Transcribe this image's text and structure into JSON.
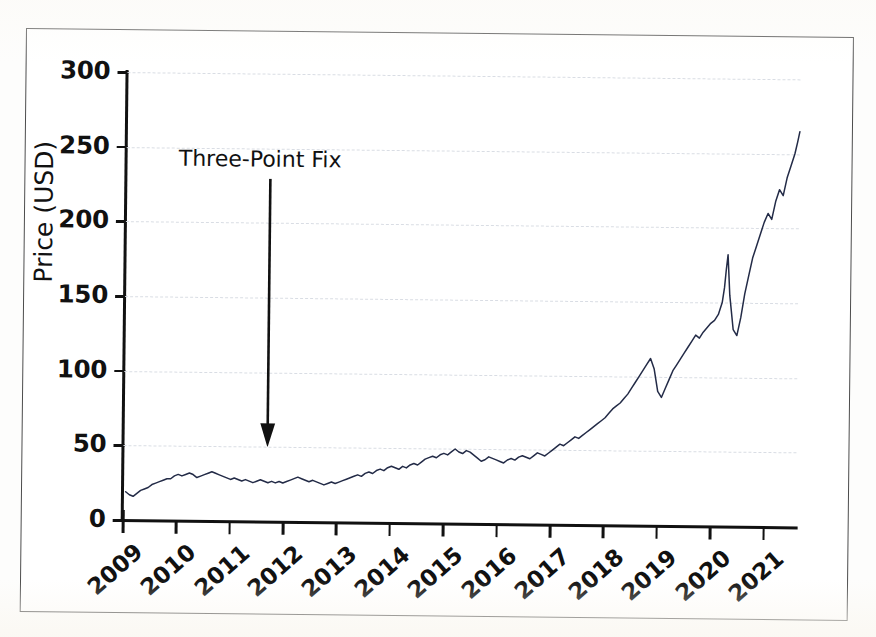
{
  "figure": {
    "frame_border_color": "#4c4c4c",
    "background": "#ffffff"
  },
  "chart_data": {
    "type": "line",
    "title": "",
    "subtitle": "",
    "xlabel": "",
    "ylabel": "Price (USD)",
    "xlim": [
      2009,
      2021.6
    ],
    "ylim": [
      0,
      300
    ],
    "ytick_labels": [
      "300",
      "250",
      "200",
      "150",
      "100",
      "50",
      "0"
    ],
    "ytick_values": [
      300,
      250,
      200,
      150,
      100,
      50,
      0
    ],
    "xtick_labels": [
      "2009",
      "2010",
      "2011",
      "2012",
      "2013",
      "2014",
      "2015",
      "2016",
      "2017",
      "2018",
      "2019",
      "2020",
      "2021"
    ],
    "xtick_values": [
      2009,
      2010,
      2011,
      2012,
      2013,
      2014,
      2015,
      2016,
      2017,
      2018,
      2019,
      2020,
      2021
    ],
    "grid": true,
    "grid_color": "#d9dde4",
    "grid_style": "dashed",
    "legend": "none",
    "series": [
      {
        "name": "Price",
        "color": "#232b47",
        "line_width": 1.5,
        "x": [
          2009.05,
          2009.12,
          2009.19,
          2009.26,
          2009.33,
          2009.4,
          2009.47,
          2009.54,
          2009.61,
          2009.68,
          2009.75,
          2009.82,
          2009.89,
          2009.96,
          2010.03,
          2010.1,
          2010.17,
          2010.24,
          2010.31,
          2010.38,
          2010.45,
          2010.52,
          2010.59,
          2010.66,
          2010.73,
          2010.8,
          2010.87,
          2010.94,
          2011.01,
          2011.08,
          2011.15,
          2011.22,
          2011.29,
          2011.36,
          2011.43,
          2011.5,
          2011.57,
          2011.64,
          2011.71,
          2011.78,
          2011.85,
          2011.92,
          2011.99,
          2012.06,
          2012.13,
          2012.2,
          2012.27,
          2012.34,
          2012.41,
          2012.48,
          2012.55,
          2012.62,
          2012.69,
          2012.76,
          2012.83,
          2012.9,
          2012.97,
          2013.04,
          2013.11,
          2013.18,
          2013.25,
          2013.32,
          2013.39,
          2013.46,
          2013.53,
          2013.6,
          2013.67,
          2013.74,
          2013.81,
          2013.88,
          2013.95,
          2014.02,
          2014.09,
          2014.16,
          2014.23,
          2014.3,
          2014.37,
          2014.44,
          2014.51,
          2014.58,
          2014.65,
          2014.72,
          2014.79,
          2014.86,
          2014.93,
          2015.0,
          2015.07,
          2015.14,
          2015.21,
          2015.28,
          2015.35,
          2015.42,
          2015.49,
          2015.56,
          2015.63,
          2015.7,
          2015.77,
          2015.84,
          2015.91,
          2015.98,
          2016.05,
          2016.12,
          2016.19,
          2016.26,
          2016.33,
          2016.4,
          2016.47,
          2016.54,
          2016.61,
          2016.68,
          2016.75,
          2016.82,
          2016.89,
          2016.96,
          2017.03,
          2017.1,
          2017.17,
          2017.24,
          2017.31,
          2017.38,
          2017.45,
          2017.52,
          2017.59,
          2017.66,
          2017.73,
          2017.8,
          2017.87,
          2017.94,
          2018.01,
          2018.08,
          2018.15,
          2018.22,
          2018.29,
          2018.36,
          2018.43,
          2018.5,
          2018.57,
          2018.64,
          2018.71,
          2018.78,
          2018.85,
          2018.92,
          2018.99,
          2019.06,
          2019.13,
          2019.2,
          2019.27,
          2019.34,
          2019.41,
          2019.48,
          2019.55,
          2019.62,
          2019.69,
          2019.76,
          2019.83,
          2019.9,
          2019.97,
          2020.04,
          2020.11,
          2020.18,
          2020.22,
          2020.25,
          2020.28,
          2020.32,
          2020.39,
          2020.46,
          2020.53,
          2020.6,
          2020.67,
          2020.74,
          2020.81,
          2020.88,
          2020.95,
          2021.02,
          2021.09,
          2021.16,
          2021.23,
          2021.3,
          2021.37,
          2021.44,
          2021.51,
          2021.56,
          2021.6
        ],
        "y": [
          19,
          17,
          16,
          18,
          20,
          21,
          22,
          24,
          25,
          26,
          27,
          28,
          28,
          30,
          31,
          30,
          31,
          32,
          31,
          29,
          30,
          31,
          32,
          33,
          32,
          31,
          30,
          29,
          28,
          29,
          28,
          27,
          28,
          27,
          26,
          27,
          28,
          27,
          26,
          27,
          26,
          27,
          26,
          27,
          28,
          29,
          30,
          29,
          28,
          27,
          28,
          27,
          26,
          25,
          26,
          27,
          26,
          27,
          28,
          29,
          30,
          31,
          32,
          31,
          33,
          34,
          33,
          35,
          36,
          35,
          37,
          38,
          37,
          36,
          38,
          37,
          39,
          40,
          39,
          41,
          43,
          44,
          45,
          44,
          46,
          47,
          46,
          48,
          50,
          48,
          47,
          49,
          48,
          46,
          44,
          42,
          43,
          45,
          44,
          43,
          42,
          41,
          43,
          44,
          43,
          45,
          46,
          45,
          44,
          46,
          48,
          47,
          46,
          48,
          50,
          52,
          54,
          53,
          55,
          57,
          59,
          58,
          60,
          62,
          64,
          66,
          68,
          70,
          72,
          75,
          78,
          80,
          82,
          85,
          88,
          92,
          96,
          100,
          104,
          108,
          112,
          105,
          90,
          86,
          92,
          98,
          104,
          108,
          112,
          116,
          120,
          124,
          128,
          126,
          130,
          133,
          136,
          138,
          142,
          150,
          160,
          172,
          182,
          155,
          132,
          128,
          140,
          156,
          168,
          180,
          188,
          196,
          204,
          210,
          206,
          218,
          226,
          222,
          234,
          242,
          250,
          258,
          265
        ]
      }
    ],
    "annotations": [
      {
        "text": "Three-Point Fix",
        "x": 2011.7,
        "y": 50,
        "arrow": "down"
      }
    ]
  }
}
